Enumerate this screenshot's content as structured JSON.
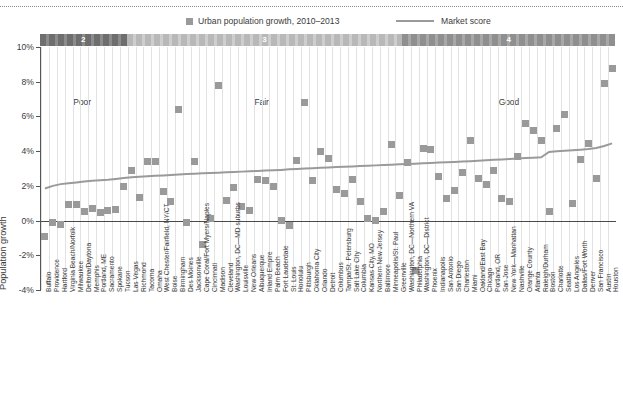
{
  "legend": {
    "series_label": "Urban population growth, 2010–2013",
    "line_label": "Market score",
    "swatch_color": "#9a9a9a",
    "line_color": "#9a9a9a"
  },
  "score_band": {
    "segments": [
      {
        "number": "2",
        "quality": "Poor"
      },
      {
        "number": "3",
        "quality": "Fair"
      },
      {
        "number": "4",
        "quality": "Good"
      }
    ]
  },
  "axis": {
    "y_title": "Population growth",
    "y_ticks": [
      "10%",
      "8%",
      "6%",
      "4%",
      "2%",
      "0%",
      "-2%",
      "-4%"
    ]
  },
  "chart_data": {
    "type": "scatter",
    "title": "",
    "subtitle": "",
    "xlabel": "",
    "ylabel": "Population growth",
    "ylim": [
      -4,
      10
    ],
    "yticks": [
      -4,
      -2,
      0,
      2,
      4,
      6,
      8,
      10
    ],
    "grid": true,
    "legend_position": "top",
    "categories": [
      "Buffalo",
      "Providence",
      "Hartford",
      "Virginia Beach/Norfolk",
      "Milwaukee",
      "Deltona/Daytona",
      "Memphis",
      "Portland, ME",
      "Sacramento",
      "Spokane",
      "Tucson",
      "Las Vegas",
      "Richmond",
      "Tacoma",
      "Omaha",
      "West Chester/Fairfield, NY/CT",
      "Boise",
      "Birmingham",
      "Des Moines",
      "Jacksonville",
      "Cape Coral/Fort Myers/Naples",
      "Cincinnati",
      "Madison",
      "Cleveland",
      "Washington, DC—MD suburbs",
      "Louisville",
      "New Orleans",
      "Albuquerque",
      "Inland Empire",
      "Palm Beach",
      "Fort Lauderdale",
      "St. Louis",
      "Honolulu",
      "Pittsburgh",
      "Oklahoma City",
      "Orlando",
      "Detroit",
      "Columbus",
      "Tampa/St. Petersburg",
      "Salt Lake City",
      "Columbia",
      "Kansas City, MO",
      "Northern New Jersey",
      "Baltimore",
      "Minneapolis/St. Paul",
      "Greenville",
      "Washington, DC—Northern VA",
      "Philadelphia",
      "Washington, DC—District",
      "Phoenix",
      "Indianapolis",
      "San Antonio",
      "San Diego",
      "Charleston",
      "Miami",
      "Oakland/East Bay",
      "Chicago",
      "Portland, OR",
      "San Jose",
      "New York—Manhattan",
      "Nashville",
      "Orange County",
      "Atlanta",
      "Raleigh/Durham",
      "Boston",
      "Charlotte",
      "Seattle",
      "Los Angeles",
      "Dallas/Fort Worth",
      "Denver",
      "San Francisco",
      "Austin",
      "Houston"
    ],
    "series": [
      {
        "name": "Urban population growth, 2010–2013",
        "type": "scatter",
        "marker": "square",
        "color": "#9a9a9a",
        "values": [
          -0.9,
          -0.1,
          -0.2,
          0.9,
          0.9,
          0.5,
          0.7,
          0.45,
          0.6,
          0.65,
          1.95,
          2.9,
          1.35,
          3.4,
          3.4,
          1.7,
          1.1,
          6.4,
          -0.1,
          3.4,
          -1.4,
          0.1,
          7.8,
          1.15,
          1.9,
          0.8,
          0.6,
          2.35,
          2.3,
          1.95,
          0.0,
          -0.3,
          3.45,
          6.8,
          2.3,
          4.0,
          3.6,
          1.8,
          1.55,
          2.35,
          1.1,
          0.1,
          0.0,
          0.55,
          4.4,
          1.45,
          3.35,
          -2.9,
          4.15,
          4.1,
          2.55,
          1.3,
          1.75,
          2.75,
          4.6,
          2.4,
          2.1,
          2.9,
          1.3,
          1.1,
          3.7,
          5.6,
          5.2,
          4.6,
          0.55,
          5.3,
          6.1,
          1.0,
          3.5,
          4.45,
          2.4,
          7.9,
          8.75
        ]
      },
      {
        "name": "Market score",
        "type": "line",
        "color": "#9a9a9a",
        "values": [
          1.85,
          2.0,
          2.1,
          2.15,
          2.2,
          2.25,
          2.3,
          2.32,
          2.35,
          2.4,
          2.45,
          2.5,
          2.52,
          2.55,
          2.58,
          2.6,
          2.62,
          2.65,
          2.68,
          2.7,
          2.72,
          2.74,
          2.76,
          2.78,
          2.8,
          2.82,
          2.84,
          2.86,
          2.88,
          2.9,
          2.92,
          2.95,
          2.97,
          3.0,
          3.02,
          3.04,
          3.06,
          3.08,
          3.1,
          3.12,
          3.14,
          3.16,
          3.18,
          3.2,
          3.22,
          3.24,
          3.26,
          3.28,
          3.3,
          3.32,
          3.34,
          3.36,
          3.38,
          3.4,
          3.42,
          3.45,
          3.48,
          3.5,
          3.52,
          3.55,
          3.58,
          3.6,
          3.62,
          3.65,
          3.95,
          4.0,
          4.02,
          4.05,
          4.08,
          4.12,
          4.18,
          4.3,
          4.45
        ]
      }
    ],
    "score_bands": [
      {
        "number": "2",
        "quality": "Poor",
        "start_index": 0,
        "end_index": 11
      },
      {
        "number": "3",
        "quality": "Fair",
        "start_index": 11,
        "end_index": 46
      },
      {
        "number": "4",
        "quality": "Good",
        "start_index": 46,
        "end_index": 73
      }
    ]
  }
}
